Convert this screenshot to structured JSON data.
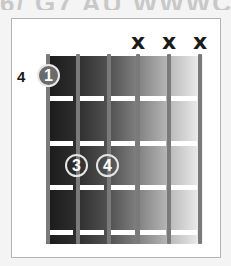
{
  "diagram": {
    "type": "guitar-chord-diagram",
    "header_fragment": "6/ G7 AU WWWC",
    "base_fret_label": "4",
    "strings": 6,
    "frets_shown": 4,
    "muted_strings": [
      {
        "string_index": 4,
        "symbol": "x"
      },
      {
        "string_index": 5,
        "symbol": "x"
      },
      {
        "string_index": 6,
        "symbol": "x"
      }
    ],
    "fingers": [
      {
        "finger": "1",
        "string_index": 1,
        "fret": 1
      },
      {
        "finger": "3",
        "string_index": 2,
        "fret": 3
      },
      {
        "finger": "4",
        "string_index": 3,
        "fret": 3
      }
    ],
    "colors": {
      "board_dark": "#1a1a1a",
      "board_light": "#f2f2f2",
      "string": "#7a7a7a",
      "fret": "#ffffff",
      "finger_fill": "#6b6b6b",
      "frame_border": "#b5b5b5"
    }
  }
}
